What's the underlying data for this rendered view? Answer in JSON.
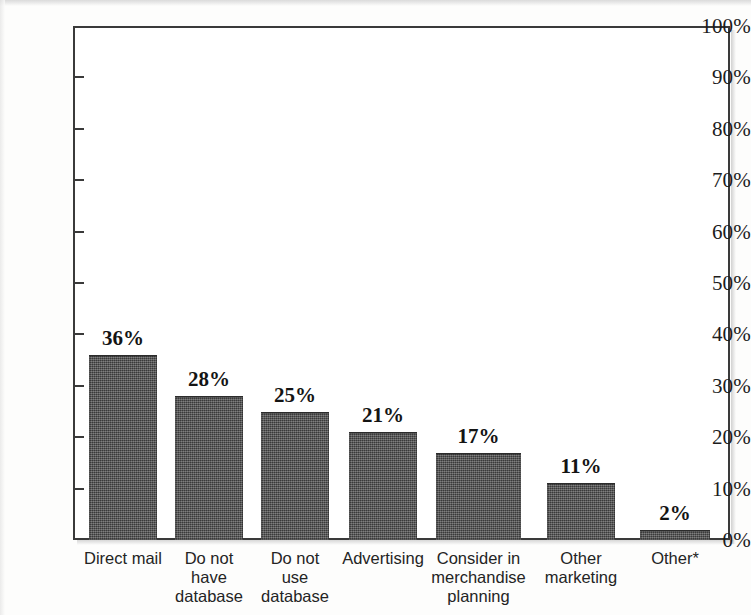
{
  "chart_data": {
    "type": "bar",
    "title": "",
    "subtitle": "",
    "xlabel": "",
    "ylabel": "",
    "ylim": [
      0,
      100
    ],
    "y_tick_labels": [
      "100%",
      "90%",
      "80%",
      "70%",
      "60%",
      "50%",
      "40%",
      "30%",
      "20%",
      "10%",
      "0%"
    ],
    "y_tick_values": [
      100,
      90,
      80,
      70,
      60,
      50,
      40,
      30,
      20,
      10,
      0
    ],
    "grid": false,
    "legend": false,
    "legend_position": "none",
    "categories": [
      "Direct mail",
      "Do not\nhave\ndatabase",
      "Do not\nuse\ndatabase",
      "Advertising",
      "Consider in\nmerchandise\nplanning",
      "Other\nmarketing",
      "Other*"
    ],
    "values": [
      36,
      28,
      25,
      21,
      17,
      11,
      2
    ],
    "value_labels": [
      "36%",
      "28%",
      "25%",
      "21%",
      "17%",
      "11%",
      "2%"
    ],
    "bar_color": "#4d4d4d",
    "axis_color": "#3a3a3a",
    "background_color": "#ffffff",
    "footnote_marker": "*"
  }
}
